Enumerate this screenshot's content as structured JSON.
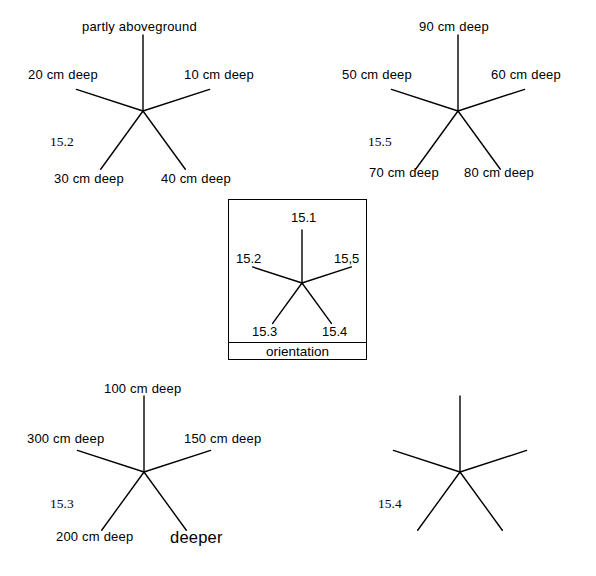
{
  "page": {
    "background_color": "#ffffff",
    "line_color": "#000000",
    "width": 596,
    "height": 576
  },
  "figures": [
    {
      "id": "fig-15-2",
      "number": "15.2",
      "number_pos": {
        "x": 50,
        "y": 134
      },
      "center": {
        "x": 143,
        "y": 111
      },
      "ray_length": 68,
      "rays": [
        {
          "name": "ray-up",
          "angle_deg": -90,
          "length": 76
        },
        {
          "name": "ray-upper-right",
          "angle_deg": -18,
          "length": 70
        },
        {
          "name": "ray-lower-right",
          "angle_deg": 54,
          "length": 72
        },
        {
          "name": "ray-lower-left",
          "angle_deg": 126,
          "length": 72
        },
        {
          "name": "ray-upper-left",
          "angle_deg": 198,
          "length": 70
        }
      ],
      "labels": [
        {
          "name": "label-top",
          "text": "partly aboveground",
          "x": 82,
          "y": 20,
          "size": "normal"
        },
        {
          "name": "label-right",
          "text": "10 cm deep",
          "x": 184,
          "y": 68,
          "size": "normal"
        },
        {
          "name": "label-left",
          "text": "20 cm deep",
          "x": 28,
          "y": 68,
          "size": "normal"
        },
        {
          "name": "label-lower-left",
          "text": "30 cm deep",
          "x": 54,
          "y": 172,
          "size": "normal"
        },
        {
          "name": "label-lower-right",
          "text": "40 cm deep",
          "x": 161,
          "y": 172,
          "size": "normal"
        }
      ]
    },
    {
      "id": "fig-15-5",
      "number": "15.5",
      "number_pos": {
        "x": 368,
        "y": 134
      },
      "center": {
        "x": 458,
        "y": 111
      },
      "ray_length": 68,
      "rays": [
        {
          "name": "ray-up",
          "angle_deg": -90,
          "length": 76
        },
        {
          "name": "ray-upper-right",
          "angle_deg": -18,
          "length": 70
        },
        {
          "name": "ray-lower-right",
          "angle_deg": 54,
          "length": 72
        },
        {
          "name": "ray-lower-left",
          "angle_deg": 126,
          "length": 72
        },
        {
          "name": "ray-upper-left",
          "angle_deg": 198,
          "length": 70
        }
      ],
      "labels": [
        {
          "name": "label-top",
          "text": "90 cm deep",
          "x": 419,
          "y": 20,
          "size": "normal"
        },
        {
          "name": "label-right",
          "text": "60 cm deep",
          "x": 491,
          "y": 68,
          "size": "normal"
        },
        {
          "name": "label-left",
          "text": "50 cm deep",
          "x": 342,
          "y": 68,
          "size": "normal"
        },
        {
          "name": "label-lower-left",
          "text": "70 cm deep",
          "x": 369,
          "y": 166,
          "size": "normal"
        },
        {
          "name": "label-lower-right",
          "text": "80 cm deep",
          "x": 464,
          "y": 166,
          "size": "normal"
        }
      ]
    },
    {
      "id": "fig-15-3",
      "number": "15.3",
      "number_pos": {
        "x": 50,
        "y": 496
      },
      "center": {
        "x": 144,
        "y": 472
      },
      "ray_length": 68,
      "rays": [
        {
          "name": "ray-up",
          "angle_deg": -90,
          "length": 76
        },
        {
          "name": "ray-upper-right",
          "angle_deg": -18,
          "length": 70
        },
        {
          "name": "ray-lower-right",
          "angle_deg": 54,
          "length": 72
        },
        {
          "name": "ray-lower-left",
          "angle_deg": 126,
          "length": 72
        },
        {
          "name": "ray-upper-left",
          "angle_deg": 198,
          "length": 70
        }
      ],
      "labels": [
        {
          "name": "label-top",
          "text": "100 cm deep",
          "x": 104,
          "y": 382,
          "size": "normal"
        },
        {
          "name": "label-right",
          "text": "150 cm deep",
          "x": 184,
          "y": 432,
          "size": "normal"
        },
        {
          "name": "label-left",
          "text": "300 cm deep",
          "x": 27,
          "y": 432,
          "size": "normal"
        },
        {
          "name": "label-lower-left",
          "text": "200 cm deep",
          "x": 56,
          "y": 530,
          "size": "normal"
        },
        {
          "name": "label-lower-right",
          "text": "deeper",
          "x": 170,
          "y": 528,
          "size": "big"
        }
      ]
    },
    {
      "id": "fig-15-4",
      "number": "15.4",
      "number_pos": {
        "x": 378,
        "y": 496
      },
      "center": {
        "x": 460,
        "y": 472
      },
      "ray_length": 68,
      "rays": [
        {
          "name": "ray-up",
          "angle_deg": -90,
          "length": 76
        },
        {
          "name": "ray-upper-right",
          "angle_deg": -18,
          "length": 70
        },
        {
          "name": "ray-lower-right",
          "angle_deg": 54,
          "length": 72
        },
        {
          "name": "ray-lower-left",
          "angle_deg": 126,
          "length": 72
        },
        {
          "name": "ray-upper-left",
          "angle_deg": 198,
          "length": 70
        }
      ],
      "labels": []
    }
  ],
  "legend": {
    "name": "orientation-legend",
    "box": {
      "x": 228,
      "y": 199,
      "width": 139,
      "height": 161
    },
    "divider_y": 342,
    "caption": "orientation",
    "caption_pos": {
      "x": 228,
      "y": 344,
      "width": 139
    },
    "center": {
      "x": 302,
      "y": 283
    },
    "rays": [
      {
        "name": "ray-up",
        "angle_deg": -90,
        "length": 53
      },
      {
        "name": "ray-upper-right",
        "angle_deg": -18,
        "length": 52
      },
      {
        "name": "ray-lower-right",
        "angle_deg": 54,
        "length": 50
      },
      {
        "name": "ray-lower-left",
        "angle_deg": 126,
        "length": 50
      },
      {
        "name": "ray-upper-left",
        "angle_deg": 198,
        "length": 52
      }
    ],
    "labels": [
      {
        "name": "legend-label-top",
        "text": "15.1",
        "x": 291,
        "y": 211
      },
      {
        "name": "legend-label-upper-right",
        "text": "15,5",
        "x": 334,
        "y": 252
      },
      {
        "name": "legend-label-upper-left",
        "text": "15.2",
        "x": 236,
        "y": 252
      },
      {
        "name": "legend-label-lower-left",
        "text": "15.3",
        "x": 252,
        "y": 325
      },
      {
        "name": "legend-label-lower-right",
        "text": "15.4",
        "x": 322,
        "y": 325
      }
    ]
  }
}
